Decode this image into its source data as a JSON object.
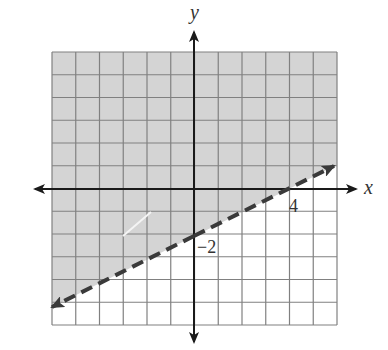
{
  "chart_data": {
    "type": "line",
    "title": "",
    "subtitle": "Linear inequality graph: y > (1/2)x - 2",
    "xlabel": "x",
    "ylabel": "y",
    "xlim": [
      -6,
      6
    ],
    "ylim": [
      -6,
      6
    ],
    "grid": true,
    "grid_step": 1,
    "boundary_line": {
      "style": "dashed",
      "slope": 0.5,
      "intercept": -2,
      "points": [
        {
          "x": -6,
          "y": -5
        },
        {
          "x": 0,
          "y": -2
        },
        {
          "x": 4,
          "y": 0
        },
        {
          "x": 6,
          "y": 1
        }
      ],
      "arrows_both_ends": true
    },
    "shaded_region": "above",
    "annotations": [
      {
        "text": "4",
        "x": 4,
        "y": 0,
        "meaning": "x-intercept"
      },
      {
        "text": "−2",
        "x": 0,
        "y": -2,
        "meaning": "y-intercept"
      }
    ],
    "legend": null
  },
  "labels": {
    "x_axis": "x",
    "y_axis": "y",
    "x_intercept": "4",
    "y_intercept": "−2"
  },
  "colors": {
    "shade": "#d4d4d4",
    "grid": "#808080",
    "axis": "#1a1a1a",
    "line": "#3a3a3a",
    "background": "#ffffff"
  }
}
